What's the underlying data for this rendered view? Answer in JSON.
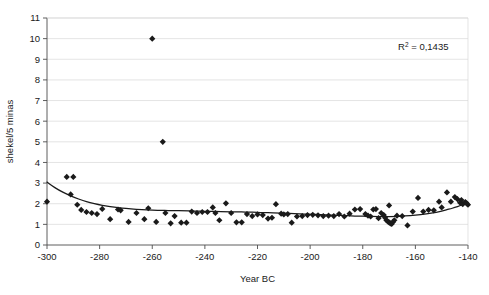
{
  "chart_data": {
    "type": "scatter",
    "title": "",
    "subtitle": "",
    "xlabel": "Year BC",
    "ylabel": "shekel/5 minas",
    "xlim": [
      -300,
      -140
    ],
    "ylim": [
      0,
      11
    ],
    "xticks": [
      -300,
      -280,
      -260,
      -240,
      -220,
      -200,
      -180,
      -160,
      -140
    ],
    "xtick_labels": [
      "-300",
      "-280",
      "-260",
      "-240",
      "-220",
      "-200",
      "-180",
      "-160",
      "-140"
    ],
    "yticks": [
      0,
      1,
      2,
      3,
      4,
      5,
      6,
      7,
      8,
      9,
      10,
      11
    ],
    "ytick_labels": [
      "0",
      "1",
      "2",
      "3",
      "4",
      "5",
      "6",
      "7",
      "8",
      "9",
      "10",
      "11"
    ],
    "grid": "horizontal",
    "legend": "none",
    "annotations": [
      {
        "name": "r-squared",
        "text": "R2 = 0,1435",
        "base": "R",
        "superscript": "2",
        "rest": " = 0,1435",
        "x": -157,
        "y": 9.45
      }
    ],
    "marker": {
      "shape": "diamond",
      "color": "#1a1a1a",
      "size": 3.1
    },
    "series": [
      {
        "name": "shekel per 5 minas observations",
        "points": [
          [
            -300.0,
            2.1
          ],
          [
            -292.5,
            3.3
          ],
          [
            -290.0,
            3.3
          ],
          [
            -291.0,
            2.45
          ],
          [
            -288.5,
            1.95
          ],
          [
            -287.0,
            1.7
          ],
          [
            -285.0,
            1.6
          ],
          [
            -283.0,
            1.55
          ],
          [
            -281.0,
            1.5
          ],
          [
            -279.0,
            1.75
          ],
          [
            -276.0,
            1.25
          ],
          [
            -273.0,
            1.72
          ],
          [
            -272.0,
            1.68
          ],
          [
            -269.0,
            1.12
          ],
          [
            -266.0,
            1.55
          ],
          [
            -263.0,
            1.25
          ],
          [
            -261.5,
            1.78
          ],
          [
            -260.0,
            10.0
          ],
          [
            -258.5,
            1.12
          ],
          [
            -256.0,
            5.0
          ],
          [
            -255.0,
            1.55
          ],
          [
            -253.0,
            1.05
          ],
          [
            -251.5,
            1.4
          ],
          [
            -249.0,
            1.08
          ],
          [
            -247.0,
            1.08
          ],
          [
            -245.0,
            1.62
          ],
          [
            -243.0,
            1.55
          ],
          [
            -241.0,
            1.6
          ],
          [
            -239.0,
            1.6
          ],
          [
            -237.0,
            1.82
          ],
          [
            -236.0,
            1.55
          ],
          [
            -234.5,
            1.2
          ],
          [
            -232.0,
            2.02
          ],
          [
            -230.0,
            1.55
          ],
          [
            -228.0,
            1.1
          ],
          [
            -226.0,
            1.1
          ],
          [
            -224.0,
            1.5
          ],
          [
            -222.0,
            1.4
          ],
          [
            -220.0,
            1.48
          ],
          [
            -218.0,
            1.45
          ],
          [
            -216.0,
            1.28
          ],
          [
            -214.5,
            1.32
          ],
          [
            -213.0,
            1.98
          ],
          [
            -211.0,
            1.52
          ],
          [
            -210.0,
            1.48
          ],
          [
            -208.5,
            1.5
          ],
          [
            -207.0,
            1.08
          ],
          [
            -205.0,
            1.38
          ],
          [
            -203.0,
            1.4
          ],
          [
            -201.0,
            1.45
          ],
          [
            -199.0,
            1.46
          ],
          [
            -197.0,
            1.44
          ],
          [
            -195.0,
            1.4
          ],
          [
            -193.0,
            1.42
          ],
          [
            -191.0,
            1.4
          ],
          [
            -189.0,
            1.5
          ],
          [
            -187.0,
            1.38
          ],
          [
            -185.0,
            1.52
          ],
          [
            -183.0,
            1.72
          ],
          [
            -181.0,
            1.74
          ],
          [
            -179.0,
            1.5
          ],
          [
            -178.0,
            1.42
          ],
          [
            -177.0,
            1.38
          ],
          [
            -176.0,
            1.72
          ],
          [
            -175.0,
            1.74
          ],
          [
            -174.0,
            1.3
          ],
          [
            -173.0,
            1.55
          ],
          [
            -172.0,
            1.45
          ],
          [
            -171.5,
            1.32
          ],
          [
            -171.0,
            1.2
          ],
          [
            -170.5,
            1.14
          ],
          [
            -170.0,
            1.1
          ],
          [
            -169.5,
            1.05
          ],
          [
            -169.0,
            1.02
          ],
          [
            -168.5,
            1.12
          ],
          [
            -168.0,
            1.2
          ],
          [
            -170.0,
            1.92
          ],
          [
            -167.0,
            1.42
          ],
          [
            -165.0,
            1.4
          ],
          [
            -163.0,
            0.95
          ],
          [
            -161.0,
            1.62
          ],
          [
            -159.0,
            2.28
          ],
          [
            -157.0,
            1.62
          ],
          [
            -155.0,
            1.7
          ],
          [
            -153.0,
            1.68
          ],
          [
            -151.0,
            2.1
          ],
          [
            -150.0,
            1.82
          ],
          [
            -148.0,
            2.55
          ],
          [
            -146.5,
            2.1
          ],
          [
            -145.0,
            2.32
          ],
          [
            -144.0,
            2.22
          ],
          [
            -143.0,
            2.05
          ],
          [
            -142.5,
            2.18
          ],
          [
            -142.0,
            1.98
          ],
          [
            -141.0,
            2.08
          ],
          [
            -140.5,
            2.02
          ],
          [
            -140.0,
            1.95
          ]
        ]
      }
    ],
    "trendline": {
      "name": "polynomial trend",
      "color": "#1a1a1a",
      "points": [
        [
          -300.0,
          3.05
        ],
        [
          -297.0,
          2.78
        ],
        [
          -294.0,
          2.56
        ],
        [
          -291.0,
          2.38
        ],
        [
          -288.0,
          2.23
        ],
        [
          -285.0,
          2.1
        ],
        [
          -282.0,
          2.0
        ],
        [
          -279.0,
          1.92
        ],
        [
          -276.0,
          1.86
        ],
        [
          -273.0,
          1.81
        ],
        [
          -270.0,
          1.77
        ],
        [
          -266.0,
          1.73
        ],
        [
          -262.0,
          1.7
        ],
        [
          -258.0,
          1.68
        ],
        [
          -254.0,
          1.67
        ],
        [
          -250.0,
          1.66
        ],
        [
          -246.0,
          1.65
        ],
        [
          -242.0,
          1.64
        ],
        [
          -238.0,
          1.63
        ],
        [
          -234.0,
          1.62
        ],
        [
          -230.0,
          1.61
        ],
        [
          -226.0,
          1.6
        ],
        [
          -222.0,
          1.59
        ],
        [
          -218.0,
          1.57
        ],
        [
          -214.0,
          1.56
        ],
        [
          -210.0,
          1.54
        ],
        [
          -206.0,
          1.52
        ],
        [
          -202.0,
          1.5
        ],
        [
          -198.0,
          1.48
        ],
        [
          -194.0,
          1.46
        ],
        [
          -190.0,
          1.44
        ],
        [
          -186.0,
          1.42
        ],
        [
          -182.0,
          1.4
        ],
        [
          -178.0,
          1.39
        ],
        [
          -174.0,
          1.38
        ],
        [
          -170.0,
          1.38
        ],
        [
          -166.0,
          1.39
        ],
        [
          -162.0,
          1.42
        ],
        [
          -158.0,
          1.47
        ],
        [
          -154.0,
          1.54
        ],
        [
          -150.0,
          1.64
        ],
        [
          -148.0,
          1.71
        ],
        [
          -146.0,
          1.78
        ],
        [
          -144.0,
          1.86
        ],
        [
          -142.0,
          1.95
        ],
        [
          -141.0,
          2.0
        ],
        [
          -140.0,
          2.05
        ]
      ]
    }
  },
  "plot": {
    "left_px": 47,
    "right_px": 468,
    "top_px": 18,
    "bottom_px": 245
  }
}
